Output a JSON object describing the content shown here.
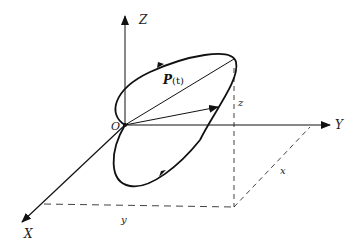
{
  "diagram": {
    "type": "3d-coordinate-trajectory",
    "labels": {
      "z_axis": "Z",
      "y_axis": "Y",
      "x_axis": "X",
      "origin": "O",
      "vector_label_bold": "P",
      "vector_label_arg": "(t)",
      "z_component": "z",
      "x_component": "x",
      "y_component": "y"
    },
    "colors": {
      "stroke": "#111111",
      "background": "#ffffff"
    }
  }
}
